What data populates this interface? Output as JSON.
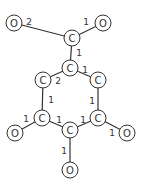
{
  "diagram": {
    "type": "molecular-graph",
    "atoms": [
      {
        "id": "a0",
        "element": "O",
        "x": 14,
        "y": 23
      },
      {
        "id": "a1",
        "element": "O",
        "x": 103,
        "y": 23
      },
      {
        "id": "a2",
        "element": "C",
        "x": 72,
        "y": 38
      },
      {
        "id": "a3",
        "element": "C",
        "x": 70,
        "y": 68
      },
      {
        "id": "a4",
        "element": "C",
        "x": 43,
        "y": 80
      },
      {
        "id": "a5",
        "element": "C",
        "x": 98,
        "y": 80
      },
      {
        "id": "a6",
        "element": "C",
        "x": 42,
        "y": 118
      },
      {
        "id": "a7",
        "element": "C",
        "x": 98,
        "y": 118
      },
      {
        "id": "a8",
        "element": "C",
        "x": 70,
        "y": 130
      },
      {
        "id": "a9",
        "element": "O",
        "x": 15,
        "y": 133
      },
      {
        "id": "a10",
        "element": "O",
        "x": 127,
        "y": 133
      },
      {
        "id": "a11",
        "element": "O",
        "x": 70,
        "y": 170
      }
    ],
    "bonds": [
      {
        "from": "a0",
        "to": "a2",
        "order": "2",
        "lx": 29,
        "ly": 22
      },
      {
        "from": "a1",
        "to": "a2",
        "order": "1",
        "lx": 86,
        "ly": 22
      },
      {
        "from": "a2",
        "to": "a3",
        "order": "1",
        "lx": 79,
        "ly": 53
      },
      {
        "from": "a3",
        "to": "a4",
        "order": "2",
        "lx": 58,
        "ly": 81
      },
      {
        "from": "a3",
        "to": "a5",
        "order": "1",
        "lx": 85,
        "ly": 70
      },
      {
        "from": "a4",
        "to": "a6",
        "order": "1",
        "lx": 51,
        "ly": 100
      },
      {
        "from": "a5",
        "to": "a7",
        "order": "1",
        "lx": 92,
        "ly": 101
      },
      {
        "from": "a6",
        "to": "a8",
        "order": "1",
        "lx": 59,
        "ly": 120
      },
      {
        "from": "a7",
        "to": "a8",
        "order": "1",
        "lx": 83,
        "ly": 120
      },
      {
        "from": "a6",
        "to": "a9",
        "order": "1",
        "lx": 26,
        "ly": 119
      },
      {
        "from": "a7",
        "to": "a10",
        "order": "1",
        "lx": 112,
        "ly": 133
      },
      {
        "from": "a8",
        "to": "a11",
        "order": "1",
        "lx": 64,
        "ly": 151
      }
    ]
  }
}
